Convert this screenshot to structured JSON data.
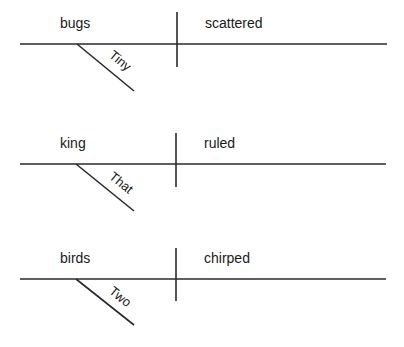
{
  "diagram_type": "Reed-Kellogg sentence diagrams",
  "colors": {
    "line": "#2a2a2a",
    "text": "#1a1a1a",
    "background": "#ffffff"
  },
  "sentences": [
    {
      "subject": "bugs",
      "predicate": "scattered",
      "modifier": "Tiny"
    },
    {
      "subject": "king",
      "predicate": "ruled",
      "modifier": "That"
    },
    {
      "subject": "birds",
      "predicate": "chirped",
      "modifier": "Two"
    }
  ]
}
